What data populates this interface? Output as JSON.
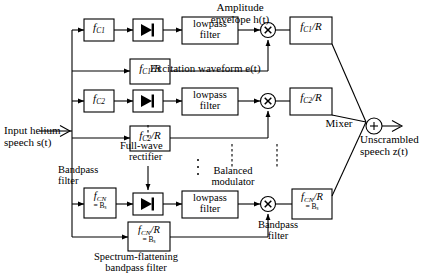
{
  "figure": {
    "type": "block-diagram",
    "background_color": "#ffffff",
    "line_color": "#000000"
  },
  "io": {
    "input_label_line1": "Input helium",
    "input_label_line2": "speech s(t)",
    "input_signal": "s(t)",
    "output_label_line1": "Unscrambled",
    "output_label_line2": "speech z(t)",
    "output_signal": "z(t)"
  },
  "annotations": {
    "amplitude_envelope_line1": "Amplitude",
    "amplitude_envelope_line2": "envelope h(t)",
    "excitation_waveform": "Excitation waveform e(t)",
    "full_wave_rectifier_line1": "Full-wave",
    "full_wave_rectifier_line2": "rectifier",
    "bandpass_filter_left_line1": "Bandpass",
    "bandpass_filter_left_line2": "filter",
    "balanced_modulator_line1": "Balanced",
    "balanced_modulator_line2": "modulator",
    "bandpass_filter_right_line1": "Bandpass",
    "bandpass_filter_right_line2": "filter",
    "spectrum_flattening_line1": "Spectrum-flattening",
    "spectrum_flattening_line2": "bandpass filter",
    "mixer": "Mixer"
  },
  "channels": [
    {
      "id": "channel-1",
      "analysis_filter": {
        "main": "f",
        "sub": "C1"
      },
      "flattening_filter": {
        "main": "f",
        "sub": "C1",
        "suffix": "/R"
      },
      "lowpass_filter_line1": "lowpass",
      "lowpass_filter_line2": "filter",
      "synthesis_filter": {
        "main": "f",
        "sub": "C1",
        "suffix": "/R"
      },
      "rectifier_icon": "full-wave-rectifier-icon",
      "modulator_icon": "multiplier-icon"
    },
    {
      "id": "channel-2",
      "analysis_filter": {
        "main": "f",
        "sub": "C2"
      },
      "flattening_filter": {
        "main": "f",
        "sub": "C2",
        "suffix": "/R"
      },
      "lowpass_filter_line1": "lowpass",
      "lowpass_filter_line2": "filter",
      "synthesis_filter": {
        "main": "f",
        "sub": "C2",
        "suffix": "/R"
      },
      "rectifier_icon": "full-wave-rectifier-icon",
      "modulator_icon": "multiplier-icon"
    },
    {
      "id": "channel-n",
      "analysis_filter": {
        "main": "f",
        "sub": "CN",
        "second_line": "= B",
        "second_line_sub": "s"
      },
      "flattening_filter": {
        "main": "f",
        "sub": "CN",
        "suffix": "/R",
        "second_line": "= B",
        "second_line_sub": "s"
      },
      "lowpass_filter_line1": "lowpass",
      "lowpass_filter_line2": "filter",
      "synthesis_filter": {
        "main": "f",
        "sub": "CN",
        "suffix": "/R",
        "second_line": "= B",
        "second_line_sub": "s"
      },
      "rectifier_icon": "full-wave-rectifier-icon",
      "modulator_icon": "multiplier-icon"
    }
  ],
  "nodes": {
    "summing_junction_symbol": "+",
    "multiplier_symbol": "×",
    "vertical_ellipsis": "⋮"
  }
}
